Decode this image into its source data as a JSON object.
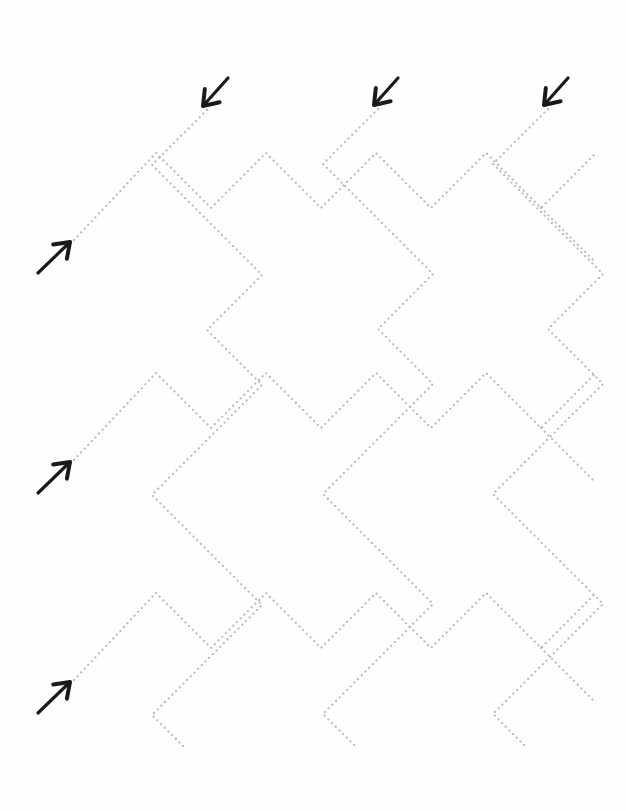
{
  "page": {
    "background_color": "#fefefe",
    "width": 626,
    "height": 811
  },
  "style": {
    "dot_color": "#b9b9bd",
    "dot_radius": 1.15,
    "dot_spacing": 5.2,
    "arrow_color": "#1a1a1a",
    "arrow_stroke_width": 3.2,
    "ghost_text_color": "#fbfbfb"
  },
  "ghost_imprint": {
    "note": "faint show-through from reverse side of the sheet, illegible",
    "lines": [
      {
        "text": "— —— — ———  ——",
        "x": 120,
        "y": 30
      },
      {
        "text": "—— ———— ————— ——",
        "x": 355,
        "y": 40
      },
      {
        "text": "— ——— —— —",
        "x": 70,
        "y": 50
      },
      {
        "text": "——— —— ————",
        "x": 380,
        "y": 56
      }
    ]
  },
  "geometry": {
    "segment_angle_degrees": 45,
    "lattice_period": 110,
    "description": "Interleaved 45-degree zigzag chains forming a herringbone lattice drawn as dotted guide lines for tracing."
  },
  "arrows": {
    "top_down_left": {
      "label": "start here, trace down-left",
      "direction": "down-left",
      "items": [
        {
          "name": "arrow-top-1",
          "tail_x": 228,
          "tail_y": 78,
          "tip_x": 203,
          "tip_y": 106
        },
        {
          "name": "arrow-top-2",
          "tail_x": 398,
          "tail_y": 78,
          "tip_x": 374,
          "tip_y": 105
        },
        {
          "name": "arrow-top-3",
          "tail_x": 568,
          "tail_y": 78,
          "tip_x": 544,
          "tip_y": 105
        }
      ]
    },
    "left_up_right": {
      "label": "start here, trace up-right",
      "direction": "up-right",
      "items": [
        {
          "name": "arrow-left-1",
          "tail_x": 38,
          "tail_y": 273,
          "tip_x": 70,
          "tip_y": 242
        },
        {
          "name": "arrow-left-2",
          "tail_x": 38,
          "tail_y": 493,
          "tip_x": 70,
          "tip_y": 462
        },
        {
          "name": "arrow-left-3",
          "tail_x": 38,
          "tail_y": 713,
          "tip_x": 70,
          "tip_y": 682
        }
      ]
    }
  },
  "paths": {
    "descending_chains": {
      "note": "Chains beginning at the three top arrows. Each goes down-left to a valley, then up-right to a peak, repeating down the page.",
      "polylines": [
        [
          [
            207,
            110
          ],
          [
            152,
            165
          ],
          [
            262,
            275
          ],
          [
            207,
            330
          ],
          [
            262,
            385
          ],
          [
            152,
            495
          ],
          [
            207,
            550
          ],
          [
            262,
            605
          ],
          [
            152,
            715
          ],
          [
            186,
            749
          ]
        ],
        [
          [
            378,
            109
          ],
          [
            323,
            164
          ],
          [
            433,
            274
          ],
          [
            378,
            329
          ],
          [
            433,
            384
          ],
          [
            323,
            494
          ],
          [
            378,
            549
          ],
          [
            433,
            604
          ],
          [
            323,
            714
          ],
          [
            357,
            748
          ]
        ],
        [
          [
            548,
            109
          ],
          [
            493,
            164
          ],
          [
            603,
            274
          ],
          [
            548,
            329
          ],
          [
            603,
            384
          ],
          [
            493,
            494
          ],
          [
            548,
            549
          ],
          [
            603,
            604
          ],
          [
            493,
            714
          ],
          [
            527,
            748
          ]
        ]
      ]
    },
    "ascending_chains": {
      "note": "Chains beginning at the three left arrows. Each goes up-right to a peak, then down-right to a valley, repeating across the page.",
      "polylines": [
        [
          [
            74,
            240
          ],
          [
            156,
            153
          ],
          [
            211,
            208
          ],
          [
            266,
            153
          ],
          [
            321,
            208
          ],
          [
            376,
            153
          ],
          [
            431,
            208
          ],
          [
            486,
            153
          ],
          [
            541,
            208
          ],
          [
            596,
            153
          ]
        ],
        [
          [
            74,
            460
          ],
          [
            156,
            373
          ],
          [
            211,
            428
          ],
          [
            266,
            373
          ],
          [
            321,
            428
          ],
          [
            376,
            373
          ],
          [
            431,
            428
          ],
          [
            486,
            373
          ],
          [
            541,
            428
          ],
          [
            596,
            373
          ]
        ],
        [
          [
            74,
            680
          ],
          [
            156,
            593
          ],
          [
            211,
            648
          ],
          [
            266,
            593
          ],
          [
            321,
            648
          ],
          [
            376,
            593
          ],
          [
            431,
            648
          ],
          [
            486,
            593
          ],
          [
            541,
            648
          ],
          [
            596,
            593
          ]
        ]
      ]
    },
    "right_tails": {
      "note": "Short dotted tails running off the right edge of the sheet.",
      "polylines": [
        [
          [
            541,
            208
          ],
          [
            596,
            263
          ]
        ],
        [
          [
            541,
            428
          ],
          [
            596,
            483
          ]
        ],
        [
          [
            541,
            648
          ],
          [
            596,
            703
          ]
        ]
      ]
    }
  }
}
